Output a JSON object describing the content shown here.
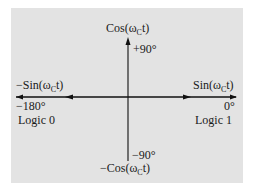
{
  "diagram": {
    "type": "BPSK phase constellation axes",
    "background_color": "#e3e3e3",
    "axes": {
      "vertical_top": {
        "prefix": "Cos(ω",
        "subscript": "C",
        "suffix": "t)",
        "angle": "+90°"
      },
      "vertical_bottom": {
        "prefix": "−Cos(ω",
        "subscript": "C",
        "suffix": "t)",
        "angle": "−90°"
      },
      "horizontal_right": {
        "prefix": "Sin(ω",
        "subscript": "C",
        "suffix": "t)",
        "angle": "0°",
        "logic": "Logic 1"
      },
      "horizontal_left": {
        "prefix": "−Sin(ω",
        "subscript": "C",
        "suffix": "t)",
        "angle": "−180°",
        "logic": "Logic 0"
      }
    }
  }
}
